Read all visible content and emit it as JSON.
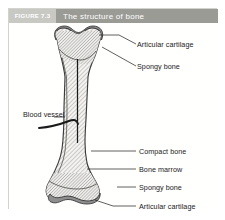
{
  "figure": {
    "number_label": "FIGURE 7.3",
    "title": "The structure of bone",
    "colors": {
      "number_bg": "#c9c9c4",
      "title_bg": "#9b9b96",
      "frame_border": "#d2d2cf",
      "page_bg": "#ffffff",
      "cartilage_fill": "#8e8e8e",
      "compact_bone_fill": "#f1f0ee",
      "hatch_stroke": "#8a8a86",
      "outline_stroke": "#3c3c3c",
      "leader_stroke": "#2b2b2b",
      "label_text": "#1b1b1b"
    }
  },
  "labels": {
    "articular_cartilage_top": "Articular cartilage",
    "spongy_bone_top": "Spongy bone",
    "blood_vessel": "Blood vessel",
    "compact_bone": "Compact bone",
    "bone_marrow": "Bone marrow",
    "spongy_bone_bottom": "Spongy bone",
    "articular_cartilage_bottom": "Articular cartilage"
  },
  "illustration": {
    "subject": "long-bone-longitudinal-section",
    "parts": [
      "articular-cartilage-cap-superior",
      "spongy-bone-superior-epiphysis",
      "compact-bone-diaphysis",
      "medullary-cavity-bone-marrow",
      "nutrient-blood-vessel",
      "spongy-bone-inferior-epiphysis",
      "articular-cartilage-cap-inferior"
    ]
  }
}
